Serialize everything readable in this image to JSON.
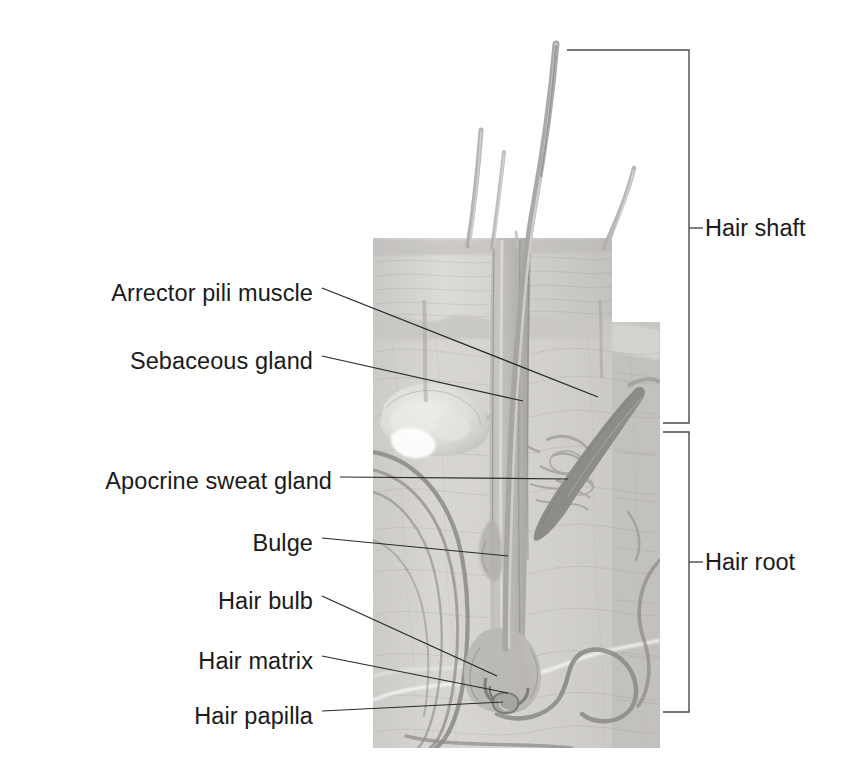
{
  "figure": {
    "background_color": "#ffffff",
    "ink_color": "#1a1a1a",
    "tissue_color": "#d8d6d4",
    "epidermis_color": "#cfcdca",
    "muscle_color": "#9a9a9a",
    "follicle_color": "#b9b7b4",
    "vessel_color": "#8e8c89"
  },
  "labels": [
    {
      "id": "arrector-pili-muscle",
      "text": "Arrector pili muscle",
      "anchor_x": 313,
      "anchor_y": 293,
      "target_x": 598,
      "target_y": 397
    },
    {
      "id": "sebaceous-gland",
      "text": "Sebaceous gland",
      "anchor_x": 313,
      "anchor_y": 361,
      "target_x": 523,
      "target_y": 401
    },
    {
      "id": "apocrine-sweat-gland",
      "text": "Apocrine sweat gland",
      "anchor_x": 332,
      "anchor_y": 481,
      "target_x": 568,
      "target_y": 481
    },
    {
      "id": "bulge",
      "text": "Bulge",
      "anchor_x": 313,
      "anchor_y": 543,
      "target_x": 508,
      "target_y": 556
    },
    {
      "id": "hair-bulb",
      "text": "Hair bulb",
      "anchor_x": 313,
      "anchor_y": 601,
      "target_x": 497,
      "target_y": 676
    },
    {
      "id": "hair-matrix",
      "text": "Hair matrix",
      "anchor_x": 313,
      "anchor_y": 661,
      "target_x": 505,
      "target_y": 693
    },
    {
      "id": "hair-papilla",
      "text": "Hair papilla",
      "anchor_x": 313,
      "anchor_y": 716,
      "target_x": 503,
      "target_y": 702
    }
  ],
  "brackets": [
    {
      "id": "hair-shaft",
      "text": "Hair shaft",
      "top_y": 50,
      "bottom_y": 423,
      "tick_y": 228,
      "spine_x": 689,
      "arm_x": 567,
      "label_x": 707
    },
    {
      "id": "hair-root",
      "text": "Hair root",
      "top_y": 432,
      "bottom_y": 712,
      "tick_y": 562,
      "spine_x": 689,
      "arm_x": 663,
      "label_x": 707
    }
  ],
  "structures": {
    "epidermis": "epidermis-layer",
    "dermis": "dermis-layer",
    "hair_shaft": "hair-shaft-strand",
    "follicle": "hair-follicle",
    "bulb": "hair-bulb-structure",
    "papilla": "dermal-papilla",
    "sebaceous": "sebaceous-gland-lobe",
    "apocrine": "apocrine-coil",
    "arrector": "arrector-pili-band",
    "vessels": "blood-vessels"
  }
}
